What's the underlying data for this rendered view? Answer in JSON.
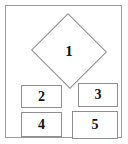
{
  "page": {
    "background_color": "#ffffff",
    "width": 128,
    "height": 144
  },
  "frame": {
    "border_color": "#9a9a9a",
    "fill_color": "#ffffff"
  },
  "shapes": [
    {
      "id": "shape-1",
      "kind": "diamond",
      "label": "1",
      "border_color": "#8e8e8e",
      "fill_color": "#ffffff"
    },
    {
      "id": "shape-2",
      "kind": "rectangle",
      "label": "2",
      "border_color": "#8e8e8e",
      "fill_color": "#ffffff"
    },
    {
      "id": "shape-3",
      "kind": "rectangle",
      "label": "3",
      "border_color": "#8e8e8e",
      "fill_color": "#ffffff"
    },
    {
      "id": "shape-4",
      "kind": "rectangle",
      "label": "4",
      "border_color": "#8e8e8e",
      "fill_color": "#ffffff"
    },
    {
      "id": "shape-5",
      "kind": "rectangle",
      "label": "5",
      "border_color": "#8e8e8e",
      "fill_color": "#ffffff"
    }
  ]
}
